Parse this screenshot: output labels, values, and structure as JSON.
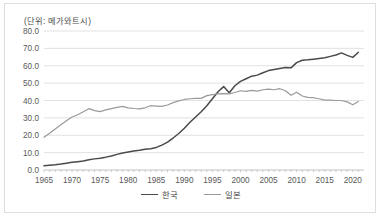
{
  "chart_data": {
    "type": "line",
    "title": "(단위: 메가와트시)",
    "xlabel": "",
    "ylabel": "",
    "xlim": [
      1965,
      2022
    ],
    "ylim": [
      0.0,
      80.0
    ],
    "ytick_step": 10.0,
    "grid": true,
    "legend_position": "bottom-center",
    "ytick_labels": [
      "0.0",
      "10.0",
      "20.0",
      "30.0",
      "40.0",
      "50.0",
      "60.0",
      "70.0",
      "80.0"
    ],
    "ytick_values": [
      0.0,
      10.0,
      20.0,
      30.0,
      40.0,
      50.0,
      60.0,
      70.0,
      80.0
    ],
    "xtick_labels": [
      "1965",
      "1970",
      "1975",
      "1980",
      "1985",
      "1990",
      "1995",
      "2000",
      "2005",
      "2010",
      "2015",
      "2020"
    ],
    "xtick_values": [
      1965,
      1970,
      1975,
      1980,
      1985,
      1990,
      1995,
      2000,
      2005,
      2010,
      2015,
      2020
    ],
    "x": [
      1965,
      1966,
      1967,
      1968,
      1969,
      1970,
      1971,
      1972,
      1973,
      1974,
      1975,
      1976,
      1977,
      1978,
      1979,
      1980,
      1981,
      1982,
      1983,
      1984,
      1985,
      1986,
      1987,
      1988,
      1989,
      1990,
      1991,
      1992,
      1993,
      1994,
      1995,
      1996,
      1997,
      1998,
      1999,
      2000,
      2001,
      2002,
      2003,
      2004,
      2005,
      2006,
      2007,
      2008,
      2009,
      2010,
      2011,
      2012,
      2013,
      2014,
      2015,
      2016,
      2017,
      2018,
      2019,
      2020,
      2021
    ],
    "series": [
      {
        "name": "한국",
        "color": "#4a4a4a",
        "values": [
          2.4,
          2.7,
          3.0,
          3.4,
          3.9,
          4.4,
          4.8,
          5.2,
          5.9,
          6.4,
          6.8,
          7.4,
          8.1,
          9.0,
          9.8,
          10.4,
          11.0,
          11.4,
          11.9,
          12.2,
          13.0,
          14.3,
          16.0,
          18.4,
          21.0,
          24.0,
          27.5,
          30.5,
          33.5,
          37.0,
          41.0,
          45.0,
          48.0,
          44.5,
          48.5,
          51.0,
          52.5,
          54.0,
          54.6,
          56.0,
          57.2,
          57.8,
          58.4,
          59.0,
          58.8,
          61.8,
          63.2,
          63.4,
          63.8,
          64.2,
          64.6,
          65.4,
          66.2,
          67.4,
          66.0,
          64.8,
          67.8
        ]
      },
      {
        "name": "일본",
        "color": "#9a9a9a",
        "values": [
          18.9,
          21.2,
          23.6,
          26.0,
          28.4,
          30.5,
          31.8,
          33.5,
          35.3,
          34.2,
          33.6,
          34.6,
          35.3,
          36.0,
          36.6,
          35.8,
          35.4,
          35.2,
          35.8,
          37.0,
          36.8,
          36.6,
          37.4,
          38.8,
          39.8,
          40.6,
          41.0,
          41.2,
          41.2,
          42.8,
          43.4,
          43.8,
          44.0,
          43.8,
          44.6,
          45.6,
          45.2,
          45.8,
          45.4,
          46.2,
          46.5,
          46.2,
          46.8,
          45.6,
          43.0,
          44.8,
          42.6,
          41.8,
          41.6,
          41.0,
          40.2,
          40.2,
          40.0,
          40.0,
          39.2,
          37.6,
          39.4
        ]
      }
    ]
  },
  "legend": {
    "items": [
      {
        "label": "한국",
        "color": "#4a4a4a"
      },
      {
        "label": "일본",
        "color": "#9a9a9a"
      }
    ]
  }
}
